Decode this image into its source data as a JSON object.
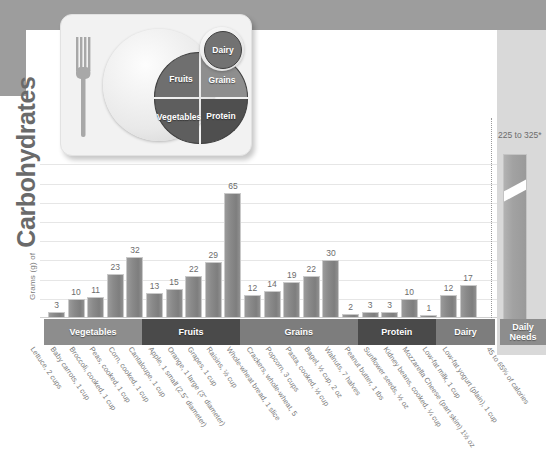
{
  "axis": {
    "y_title_small": "Grams (g) of",
    "y_title_big": "Carbohydrates"
  },
  "plate": {
    "fruits": "Fruits",
    "grains": "Grains",
    "vegetables": "Vegetables",
    "protein": "Protein",
    "dairy": "Dairy"
  },
  "daily_needs": {
    "value_label": "225 to 325*",
    "band_line1": "Daily",
    "band_line2": "Needs",
    "x_label": "45 to 65% of calories"
  },
  "bands": [
    {
      "label": "Vegetables",
      "count": 5
    },
    {
      "label": "Fruits",
      "count": 5
    },
    {
      "label": "Grains",
      "count": 6
    },
    {
      "label": "Protein",
      "count": 4
    },
    {
      "label": "Dairy",
      "count": 3
    }
  ],
  "chart_data": {
    "type": "bar",
    "xlabel": "",
    "ylabel": "Grams (g) of Carbohydrates",
    "ylim": [
      0,
      70
    ],
    "grid": true,
    "legend": "none",
    "categories": [
      "Lettuce, 2 cups",
      "Baby carrots, 1 cup",
      "Broccoli, cooked, 1 cup",
      "Peas, cooked, 1 cup",
      "Corn, cooked, 1 cup",
      "Cantaloupe, 1 cup",
      "Apple, 1 small (2.5\" diameter)",
      "Orange, 1 large (3\" diameter)",
      "Grapes, 1 cup",
      "Raisins, ½ cup",
      "Whole-wheat bread, 1 slice",
      "Crackers, whole-wheat, 5",
      "Popcorn, 3 cups",
      "Pasta, cooked, ½ cup",
      "Bagel, ½ cup, 2 oz",
      "Walnuts, 7 halves",
      "Peanut butter, 1 tbs",
      "Sunflower seeds, ½ oz",
      "Kidney beans, cooked, ¼ cup",
      "Mozzarella Cheese (part skim) 1½ oz",
      "Low-fat milk, 1 cup",
      "Low-fat yogurt (plain), 1 cup",
      "45 to 65% of calories"
    ],
    "values": [
      3,
      10,
      11,
      23,
      32,
      13,
      15,
      22,
      29,
      65,
      12,
      14,
      19,
      22,
      30,
      2,
      3,
      3,
      10,
      1,
      12,
      17,
      275
    ],
    "value_labels": [
      "3",
      "10",
      "11",
      "23",
      "32",
      "13",
      "15",
      "22",
      "29",
      "65",
      "12",
      "14",
      "19",
      "22",
      "30",
      "2",
      "3",
      "3",
      "10",
      "1",
      "12",
      "17",
      "225 to 325*"
    ],
    "groups": [
      "Vegetables",
      "Vegetables",
      "Vegetables",
      "Vegetables",
      "Vegetables",
      "Fruits",
      "Fruits",
      "Fruits",
      "Fruits",
      "Fruits",
      "Grains",
      "Grains",
      "Grains",
      "Grains",
      "Grains",
      "Grains",
      "Protein",
      "Protein",
      "Protein",
      "Protein",
      "Dairy",
      "Dairy",
      "Dairy"
    ]
  },
  "colors": {
    "bar": "#8a8a8a",
    "bar_border": "#c9c9c9",
    "band_light": "#8d8d8d",
    "band_dark": "#4a4a4a",
    "backdrop": "#9d9d9d",
    "text": "#6c6c6c"
  }
}
